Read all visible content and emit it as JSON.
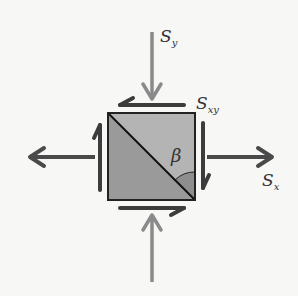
{
  "diagram": {
    "labels": {
      "sy": "S",
      "sy_sub": "y",
      "sxy": "S",
      "sxy_sub": "xy",
      "sx": "S",
      "sx_sub": "x",
      "beta": "β"
    },
    "colors": {
      "background": "#f7f7f5",
      "square_light": "#b4b4b4",
      "square_dark": "#9a9a9a",
      "outline": "#222222",
      "dark_arrow": "#4a4a4a",
      "light_arrow": "#8a8a8a",
      "angle_fill": "#8e8e8e"
    },
    "elements": [
      {
        "id": "normal-stress-y-top",
        "direction": "down",
        "label": "Sy"
      },
      {
        "id": "normal-stress-y-bottom",
        "direction": "up"
      },
      {
        "id": "normal-stress-x-left",
        "direction": "left"
      },
      {
        "id": "normal-stress-x-right",
        "direction": "right",
        "label": "Sx"
      },
      {
        "id": "shear-top",
        "direction": "left",
        "label": "Sxy"
      },
      {
        "id": "shear-bottom",
        "direction": "right"
      },
      {
        "id": "shear-left",
        "direction": "up"
      },
      {
        "id": "shear-right",
        "direction": "down"
      },
      {
        "id": "diagonal-plane",
        "angle_label": "β"
      }
    ]
  }
}
